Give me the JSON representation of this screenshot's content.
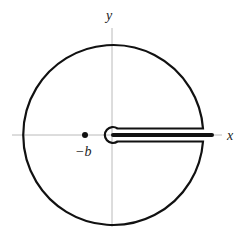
{
  "diagram": {
    "labels": {
      "x_axis": "x",
      "y_axis": "y",
      "point": "−b"
    },
    "geometry": {
      "origin": [
        112,
        135
      ],
      "outer_circle_radius": 90,
      "inner_circle_radius": 8,
      "keyhole_half_width": 6.5,
      "branch_cut_end_x": 213,
      "point_position": [
        85,
        135
      ]
    },
    "colors": {
      "contour": "#111111",
      "axes": "#a8a8a8",
      "background": "#ffffff"
    }
  }
}
